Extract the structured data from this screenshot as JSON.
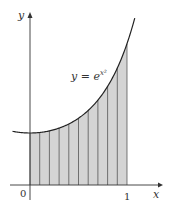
{
  "figure": {
    "curve_label": "y = e",
    "curve_label_exponent": "x²",
    "x_axis_label": "x",
    "y_axis_label": "y",
    "origin_label": "0",
    "x_tick_label": "1"
  },
  "chart_data": {
    "type": "area",
    "title": "",
    "function": "y = e^(x^2)",
    "xlabel": "x",
    "ylabel": "y",
    "x_ticks": [
      "0",
      "1"
    ],
    "shaded_interval": [
      0,
      1
    ],
    "num_strips": 10,
    "strip_edges": [
      0,
      0.1,
      0.2,
      0.3,
      0.4,
      0.5,
      0.6,
      0.7,
      0.8,
      0.9,
      1.0
    ],
    "curve_values": [
      1.0,
      1.01,
      1.041,
      1.094,
      1.174,
      1.284,
      1.433,
      1.632,
      1.896,
      2.248,
      2.718
    ],
    "colors": {
      "shade": "#d4d4d4",
      "line": "#222222"
    }
  }
}
